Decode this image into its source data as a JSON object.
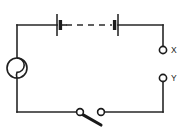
{
  "diagram": {
    "title": "Series battery circuit with source, open switch and output terminals X and Y",
    "type": "electrical-schematic",
    "canvas": {
      "width": 189,
      "height": 136,
      "background": "#ffffff"
    },
    "line_color": "#262626",
    "labels": {
      "terminal_x": "X",
      "terminal_y": "Y"
    },
    "components": [
      {
        "name": "source",
        "kind": "circular-source",
        "cx": 17,
        "cy": 68,
        "r": 10
      },
      {
        "name": "battery-cell-left",
        "kind": "cell",
        "x": 57,
        "y": 25
      },
      {
        "name": "battery-cell-right",
        "kind": "cell",
        "x": 115,
        "y": 25
      },
      {
        "name": "dashed-link",
        "kind": "dashed-connection",
        "x1": 66,
        "x2": 112,
        "y": 25
      },
      {
        "name": "knife-switch",
        "kind": "switch-open",
        "pivot_x": 80,
        "contact_x": 101,
        "y": 112
      },
      {
        "name": "terminal-x",
        "kind": "open-terminal",
        "cx": 163,
        "cy": 50,
        "r": 3.6
      },
      {
        "name": "terminal-y",
        "kind": "open-terminal",
        "cx": 163,
        "cy": 78,
        "r": 3.6
      }
    ],
    "wires": {
      "top_y": 25,
      "bottom_y": 112,
      "left_x": 17,
      "right_x": 163
    }
  }
}
